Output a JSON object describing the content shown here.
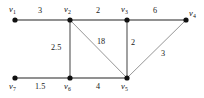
{
  "figure": {
    "type": "weighted-undirected-graph",
    "background_color": "#ffffff",
    "node_color": "#111111",
    "edge_color": "#6e6e6e",
    "diagonal_edge_color": "#8a8a8a",
    "text_color": "#111111"
  },
  "vertices": [
    {
      "id": "v1",
      "label": "v",
      "subscript": "1",
      "x": 15,
      "y": 20,
      "label_x": 9,
      "label_y": 5,
      "label_align": "left"
    },
    {
      "id": "v2",
      "label": "v",
      "subscript": "2",
      "x": 70,
      "y": 20,
      "label_x": 64,
      "label_y": 5,
      "label_align": "left"
    },
    {
      "id": "v3",
      "label": "v",
      "subscript": "3",
      "x": 127,
      "y": 20,
      "label_x": 121,
      "label_y": 5,
      "label_align": "left"
    },
    {
      "id": "v4",
      "label": "v",
      "subscript": "4",
      "x": 186,
      "y": 20,
      "label_x": 189,
      "label_y": 9,
      "label_align": "left"
    },
    {
      "id": "v5",
      "label": "v",
      "subscript": "5",
      "x": 127,
      "y": 78,
      "label_x": 121,
      "label_y": 82,
      "label_align": "left"
    },
    {
      "id": "v6",
      "label": "v",
      "subscript": "6",
      "x": 70,
      "y": 78,
      "label_x": 64,
      "label_y": 82,
      "label_align": "left"
    },
    {
      "id": "v7",
      "label": "v",
      "subscript": "7",
      "x": 15,
      "y": 78,
      "label_x": 9,
      "label_y": 82,
      "label_align": "left"
    }
  ],
  "edges": [
    {
      "id": "e-v1-v2",
      "from": "v1",
      "to": "v2",
      "weight": "3",
      "style": "horizontal",
      "label_x": 38,
      "label_y": 7
    },
    {
      "id": "e-v2-v3",
      "from": "v2",
      "to": "v3",
      "weight": "2",
      "style": "horizontal",
      "label_x": 96,
      "label_y": 7
    },
    {
      "id": "e-v3-v4",
      "from": "v3",
      "to": "v4",
      "weight": "6",
      "style": "horizontal",
      "label_x": 153,
      "label_y": 7
    },
    {
      "id": "e-v2-v6",
      "from": "v2",
      "to": "v6",
      "weight": "2.5",
      "style": "vertical",
      "label_x": 51,
      "label_y": 44
    },
    {
      "id": "e-v2-v5",
      "from": "v2",
      "to": "v5",
      "weight": "18",
      "style": "diagonal",
      "label_x": 97,
      "label_y": 38
    },
    {
      "id": "e-v3-v5",
      "from": "v3",
      "to": "v5",
      "weight": "2",
      "style": "vertical",
      "label_x": 131,
      "label_y": 39
    },
    {
      "id": "e-v5-v4",
      "from": "v5",
      "to": "v4",
      "weight": "3",
      "style": "diagonal",
      "label_x": 161,
      "label_y": 50
    },
    {
      "id": "e-v7-v6",
      "from": "v7",
      "to": "v6",
      "weight": "1.5",
      "style": "horizontal",
      "label_x": 35,
      "label_y": 83
    },
    {
      "id": "e-v6-v5",
      "from": "v6",
      "to": "v5",
      "weight": "4",
      "style": "horizontal",
      "label_x": 96,
      "label_y": 83
    }
  ]
}
